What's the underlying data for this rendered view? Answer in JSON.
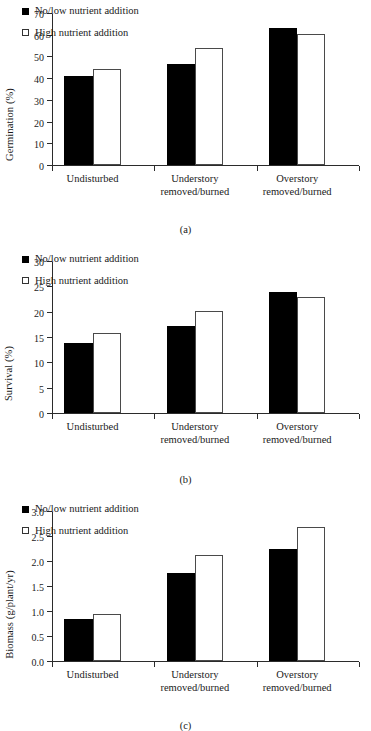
{
  "figure": {
    "legend": {
      "series": [
        {
          "label": "No/low nutrient addition",
          "marker": "filled-square",
          "color": "#000000"
        },
        {
          "label": "High nutrient addition",
          "marker": "open-square",
          "color": "#ffffff"
        }
      ]
    },
    "categories_display": [
      {
        "line1": "Undisturbed",
        "line2": ""
      },
      {
        "line1": "Understory",
        "line2": "removed/burned"
      },
      {
        "line1": "Overstory",
        "line2": "removed/burned"
      }
    ],
    "panels": [
      {
        "caption": "(a)"
      },
      {
        "caption": "(b)"
      },
      {
        "caption": "(c)"
      }
    ]
  },
  "chart_data": [
    {
      "type": "bar",
      "panel": "a",
      "title": "",
      "xlabel": "",
      "ylabel": "Germination (%)",
      "categories": [
        "Undisturbed",
        "Understory removed/burned",
        "Overstory removed/burned"
      ],
      "series": [
        {
          "name": "No/low nutrient addition",
          "values": [
            41.4,
            46.8,
            63.4
          ]
        },
        {
          "name": "High nutrient addition",
          "values": [
            44.3,
            54.3,
            60.8
          ]
        }
      ],
      "ylim": [
        0,
        70
      ],
      "yticks": [
        0,
        10,
        20,
        30,
        40,
        50,
        60,
        70
      ],
      "grid": false,
      "legend_position": "upper-left"
    },
    {
      "type": "bar",
      "panel": "b",
      "title": "",
      "xlabel": "",
      "ylabel": "Survival (%)",
      "categories": [
        "Undisturbed",
        "Understory removed/burned",
        "Overstory removed/burned"
      ],
      "series": [
        {
          "name": "No/low nutrient addition",
          "values": [
            14.0,
            17.2,
            24.0
          ]
        },
        {
          "name": "High nutrient addition",
          "values": [
            15.8,
            20.3,
            23.0
          ]
        }
      ],
      "ylim": [
        0,
        30
      ],
      "yticks": [
        0,
        5,
        10,
        15,
        20,
        25,
        30
      ],
      "grid": false,
      "legend_position": "upper-left"
    },
    {
      "type": "bar",
      "panel": "c",
      "title": "",
      "xlabel": "",
      "ylabel": "Biomass (g/plant/yr)",
      "categories": [
        "Undisturbed",
        "Understory removed/burned",
        "Overstory removed/burned"
      ],
      "series": [
        {
          "name": "No/low nutrient addition",
          "values": [
            0.85,
            1.78,
            2.26
          ]
        },
        {
          "name": "High nutrient addition",
          "values": [
            0.95,
            2.13,
            2.7
          ]
        }
      ],
      "ylim": [
        0.0,
        3.0
      ],
      "yticks": [
        "0.0",
        "0.5",
        "1.0",
        "1.5",
        "2.0",
        "2.5",
        "3.0"
      ],
      "grid": false,
      "legend_position": "upper-left"
    }
  ]
}
